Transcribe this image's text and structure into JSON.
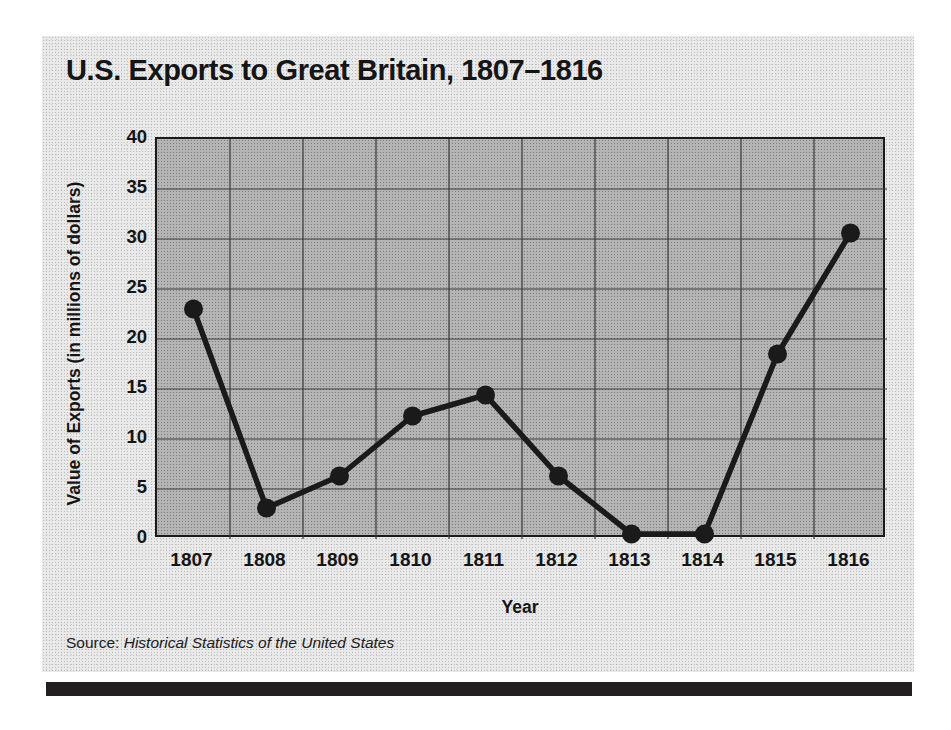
{
  "figure": {
    "title": "U.S. Exports to Great Britain, 1807–1816",
    "source_prefix": "Source:",
    "source_title": "Historical Statistics of the United States"
  },
  "chart_data": {
    "type": "line",
    "title": "U.S. Exports to Great Britain, 1807–1816",
    "xlabel": "Year",
    "ylabel": "Value of Exports (in millions of dollars)",
    "categories": [
      "1807",
      "1808",
      "1809",
      "1810",
      "1811",
      "1812",
      "1813",
      "1814",
      "1815",
      "1816"
    ],
    "values": [
      23.0,
      3.1,
      6.3,
      12.3,
      14.4,
      6.3,
      0.5,
      0.5,
      18.5,
      30.6
    ],
    "ylim": [
      0,
      40
    ],
    "ytick_labels": [
      "0",
      "5",
      "10",
      "15",
      "20",
      "25",
      "30",
      "35",
      "40"
    ],
    "ytick_values": [
      0,
      5,
      10,
      15,
      20,
      25,
      30,
      35,
      40
    ],
    "xtick_labels": [
      "1807",
      "1808",
      "1809",
      "1810",
      "1811",
      "1812",
      "1813",
      "1814",
      "1815",
      "1816"
    ],
    "grid": true,
    "legend": "none",
    "series_color": "#1a1a1a",
    "plot_background": "#b4b4b4",
    "marker": "filled-circle"
  }
}
